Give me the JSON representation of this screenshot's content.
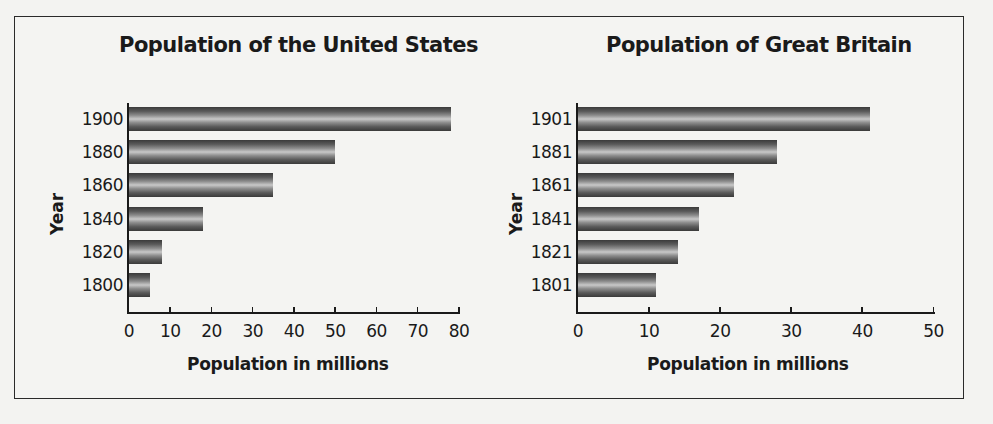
{
  "chart_data": [
    {
      "type": "bar",
      "orientation": "horizontal",
      "title": "Population of the United States",
      "xlabel": "Population in millions",
      "ylabel": "Year",
      "categories": [
        "1900",
        "1880",
        "1860",
        "1840",
        "1820",
        "1800"
      ],
      "values": [
        78,
        50,
        35,
        18,
        8,
        5
      ],
      "xlim": [
        0,
        80
      ],
      "xticks": [
        "0",
        "10",
        "20",
        "30",
        "40",
        "50",
        "60",
        "70",
        "80"
      ],
      "grid": false,
      "legend": null
    },
    {
      "type": "bar",
      "orientation": "horizontal",
      "title": "Population of Great Britain",
      "xlabel": "Population in millions",
      "ylabel": "Year",
      "categories": [
        "1901",
        "1881",
        "1861",
        "1841",
        "1821",
        "1801"
      ],
      "values": [
        41,
        28,
        22,
        17,
        14,
        11
      ],
      "xlim": [
        0,
        50
      ],
      "xticks": [
        "0",
        "10",
        "20",
        "30",
        "40",
        "50"
      ],
      "grid": false,
      "legend": null
    }
  ],
  "charts": {
    "us": {
      "title": "Population of the United States",
      "ylabel": "Year",
      "xlabel": "Population in millions",
      "categories": [
        "1900",
        "1880",
        "1860",
        "1840",
        "1820",
        "1800"
      ],
      "values": [
        78,
        50,
        35,
        18,
        8,
        5
      ],
      "max": 80,
      "ticks": [
        "0",
        "10",
        "20",
        "30",
        "40",
        "50",
        "60",
        "70",
        "80"
      ]
    },
    "gb": {
      "title": "Population of Great Britain",
      "ylabel": "Year",
      "xlabel": "Population in millions",
      "categories": [
        "1901",
        "1881",
        "1861",
        "1841",
        "1821",
        "1801"
      ],
      "values": [
        41,
        28,
        22,
        17,
        14,
        11
      ],
      "max": 50,
      "ticks": [
        "0",
        "10",
        "20",
        "30",
        "40",
        "50"
      ]
    }
  }
}
